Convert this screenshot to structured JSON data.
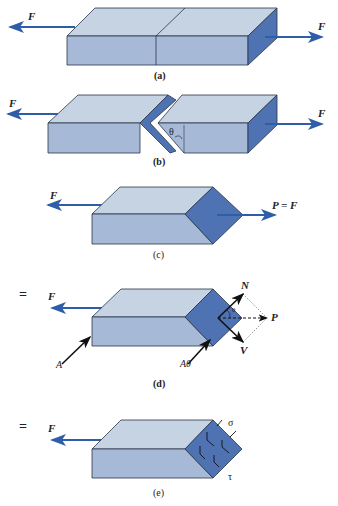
{
  "colors": {
    "top_face": "#c5d3e2",
    "front_face": "#a6b9d6",
    "section_face": "#4f72b2",
    "arrow": "#2f5ea8",
    "outline": "#2a3548"
  },
  "panels": [
    {
      "id": "a",
      "caption": "(a)",
      "labels": {
        "left_force": "F",
        "right_force": "F"
      }
    },
    {
      "id": "b",
      "caption": "(b)",
      "labels": {
        "left_force": "F",
        "right_force": "F",
        "angle": "θ"
      }
    },
    {
      "id": "c",
      "caption": "(c)",
      "labels": {
        "left_force": "F",
        "right_force": "P = F"
      }
    },
    {
      "id": "d",
      "caption": "(d)",
      "prefix": "=",
      "labels": {
        "left_force": "F",
        "area": "A",
        "area_theta": "Aθ",
        "normal": "N",
        "shear": "V",
        "resultant": "P",
        "angle": "θ"
      }
    },
    {
      "id": "e",
      "caption": "(e)",
      "prefix": "=",
      "labels": {
        "left_force": "F",
        "normal_stress": "σ",
        "shear_stress": "τ"
      }
    }
  ]
}
